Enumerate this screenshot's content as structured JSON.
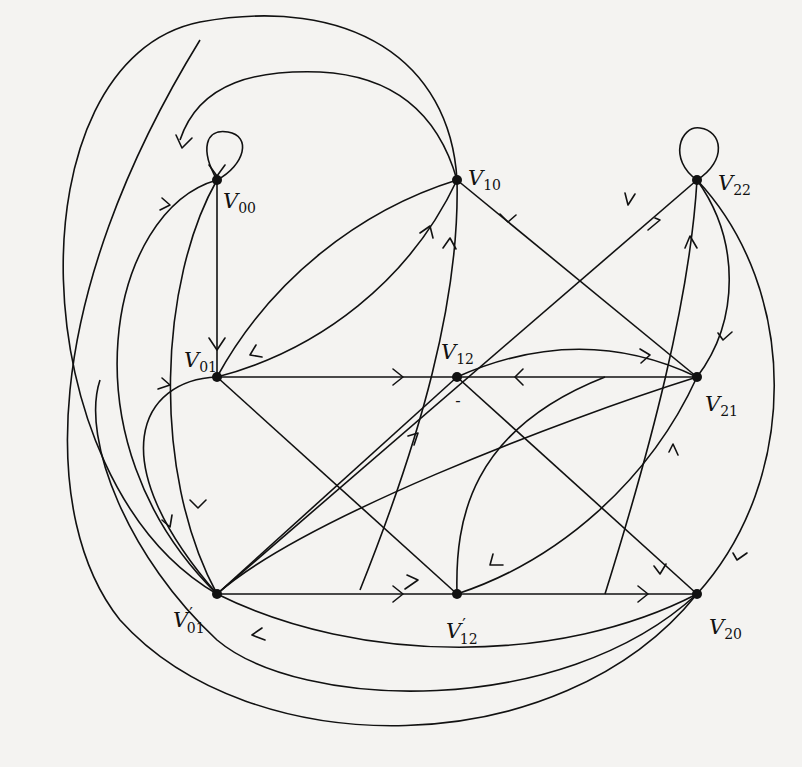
{
  "figure": {
    "type": "directed-graph",
    "nodes": [
      {
        "id": "V00",
        "base": "V",
        "sub": "00",
        "prime": "",
        "x": 217,
        "y": 180,
        "lx": 223,
        "ly": 208
      },
      {
        "id": "V10",
        "base": "V",
        "sub": "10",
        "prime": "",
        "x": 457,
        "y": 180,
        "lx": 468,
        "ly": 185
      },
      {
        "id": "V22",
        "base": "V",
        "sub": "22",
        "prime": "",
        "x": 697,
        "y": 180,
        "lx": 718,
        "ly": 190
      },
      {
        "id": "V01",
        "base": "V",
        "sub": "01",
        "prime": "",
        "x": 217,
        "y": 377,
        "lx": 184,
        "ly": 367
      },
      {
        "id": "V12",
        "base": "V",
        "sub": "12",
        "prime": "",
        "x": 457,
        "y": 377,
        "lx": 441,
        "ly": 359
      },
      {
        "id": "V21",
        "base": "V",
        "sub": "21",
        "prime": "",
        "x": 697,
        "y": 377,
        "lx": 705,
        "ly": 411
      },
      {
        "id": "V01p",
        "base": "V",
        "sub": "01",
        "prime": "′",
        "x": 217,
        "y": 594,
        "lx": 173,
        "ly": 627
      },
      {
        "id": "V12p",
        "base": "V",
        "sub": "12",
        "prime": "′",
        "x": 457,
        "y": 594,
        "lx": 446,
        "ly": 638
      },
      {
        "id": "V20",
        "base": "V",
        "sub": "20",
        "prime": "",
        "x": 697,
        "y": 594,
        "lx": 709,
        "ly": 634
      }
    ],
    "extra_marks": [
      {
        "id": "v12-minus",
        "text": "-",
        "x": 458,
        "y": 406
      }
    ],
    "edges": [
      {
        "from": "V00",
        "to": "V00",
        "kind": "self-loop"
      },
      {
        "from": "V22",
        "to": "V22",
        "kind": "self-loop"
      },
      {
        "from": "V00",
        "to": "V01",
        "kind": "straight"
      },
      {
        "from": "V10",
        "to": "V01",
        "kind": "curve"
      },
      {
        "from": "V01",
        "to": "V10",
        "kind": "curve"
      },
      {
        "from": "V12p",
        "to": "V10",
        "kind": "curve"
      },
      {
        "from": "V01p",
        "to": "V22",
        "kind": "straight"
      },
      {
        "from": "V12",
        "to": "V22",
        "kind": "curve"
      },
      {
        "from": "V01",
        "to": "V12",
        "kind": "straight"
      },
      {
        "from": "V01",
        "to": "V12p",
        "kind": "straight"
      },
      {
        "from": "V10",
        "to": "V21",
        "kind": "straight"
      },
      {
        "from": "V01p",
        "to": "V12",
        "kind": "straight"
      },
      {
        "from": "V01p",
        "to": "V12p",
        "kind": "straight"
      },
      {
        "from": "V12p",
        "to": "V20",
        "kind": "straight"
      },
      {
        "from": "V20",
        "to": "V01p",
        "kind": "curve"
      },
      {
        "from": "V21",
        "to": "V12",
        "kind": "straight"
      },
      {
        "from": "V12",
        "to": "V21",
        "kind": "curve"
      },
      {
        "from": "V21",
        "to": "V01p",
        "kind": "curve"
      },
      {
        "from": "V12p",
        "to": "V21",
        "kind": "curve"
      },
      {
        "from": "V12",
        "to": "V20",
        "kind": "straight"
      },
      {
        "from": "V22",
        "to": "V21",
        "kind": "curve"
      },
      {
        "from": "V22",
        "to": "V20",
        "kind": "curve"
      },
      {
        "from": "V01",
        "to": "V00",
        "kind": "curve"
      },
      {
        "from": "V01p",
        "to": "V00",
        "kind": "curve"
      },
      {
        "from": "V00",
        "to": "V01p",
        "kind": "curve"
      },
      {
        "from": "V01p",
        "to": "V10",
        "kind": "outer-arc"
      },
      {
        "from": "V01p",
        "to": "V01",
        "kind": "curve"
      },
      {
        "from": "V10",
        "to": "V00",
        "kind": "outer-arc"
      },
      {
        "from": "V20",
        "to": "V01",
        "kind": "outer-arc"
      },
      {
        "from": "V20",
        "to": "V00",
        "kind": "outer-arc"
      }
    ]
  }
}
